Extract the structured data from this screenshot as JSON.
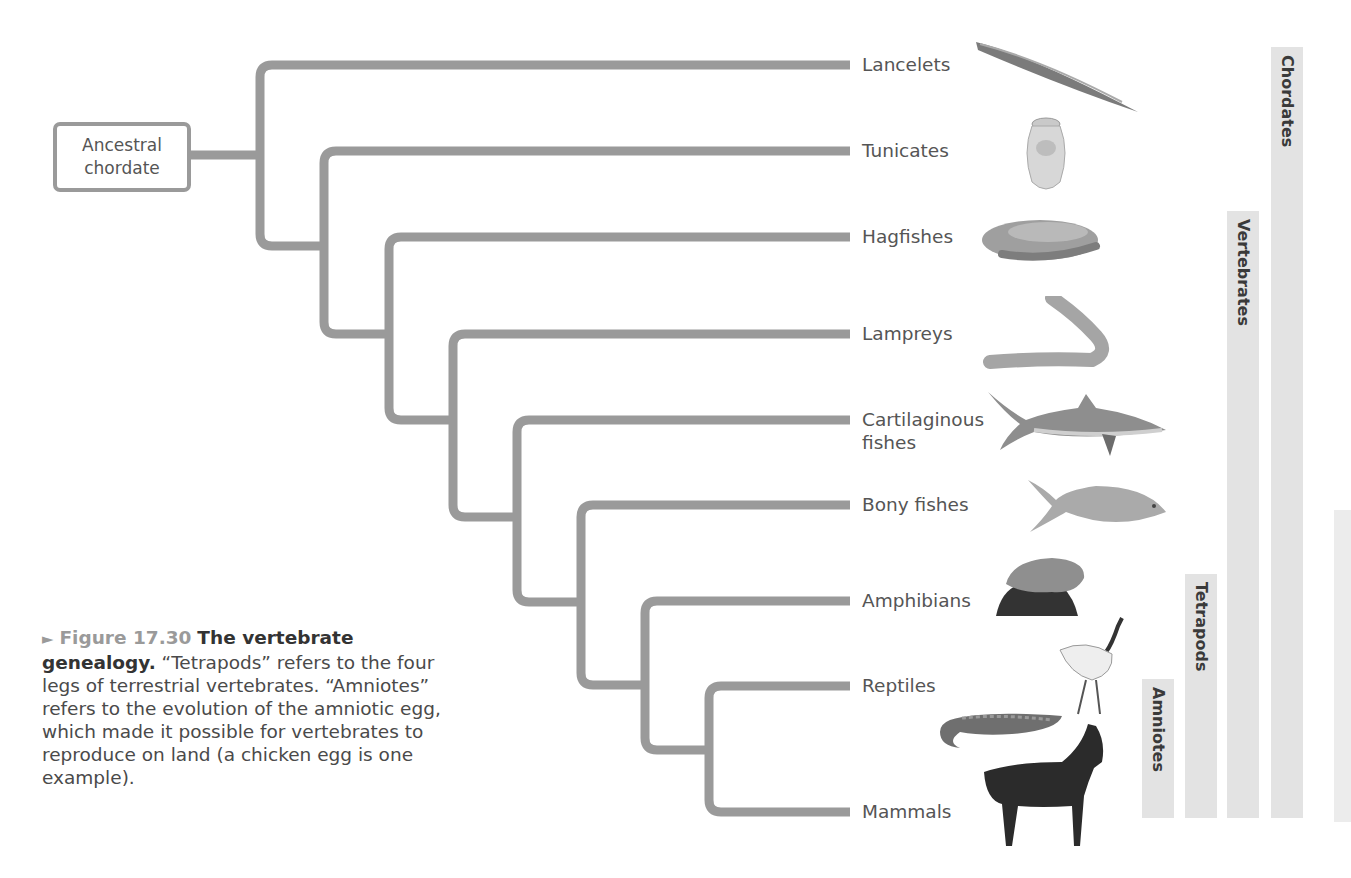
{
  "root": {
    "label_line1": "Ancestral",
    "label_line2": "chordate"
  },
  "taxa": [
    {
      "label": "Lancelets",
      "illustration": "lancelet-icon"
    },
    {
      "label": "Tunicates",
      "illustration": "tunicate-icon"
    },
    {
      "label": "Hagfishes",
      "illustration": "hagfish-icon"
    },
    {
      "label": "Lampreys",
      "illustration": "lamprey-icon"
    },
    {
      "label_line1": "Cartilaginous",
      "label_line2": "fishes",
      "illustration": "shark-icon"
    },
    {
      "label": "Bony fishes",
      "illustration": "bony-fish-icon"
    },
    {
      "label": "Amphibians",
      "illustration": "frog-icon"
    },
    {
      "label": "Reptiles",
      "illustration": "crane-and-lizard-icon"
    },
    {
      "label": "Mammals",
      "illustration": "horse-icon"
    }
  ],
  "clades": [
    {
      "label": "Amniotes",
      "spans": [
        "Reptiles",
        "Mammals"
      ]
    },
    {
      "label": "Tetrapods",
      "spans": [
        "Amphibians",
        "Reptiles",
        "Mammals"
      ]
    },
    {
      "label": "Vertebrates",
      "spans": [
        "Hagfishes",
        "Lampreys",
        "Cartilaginous fishes",
        "Bony fishes",
        "Amphibians",
        "Reptiles",
        "Mammals"
      ]
    },
    {
      "label": "Chordates",
      "spans": [
        "Lancelets",
        "Tunicates",
        "Hagfishes",
        "Lampreys",
        "Cartilaginous fishes",
        "Bony fishes",
        "Amphibians",
        "Reptiles",
        "Mammals"
      ]
    }
  ],
  "caption": {
    "arrow": "►",
    "figure_number": "Figure 17.30",
    "title": "The vertebrate genealogy.",
    "body": " “Tetrapods” refers to the four legs of terrestrial vertebrates. “Amniotes” refers to the evolution of the amniotic egg, which made it possible for vertebrates to reproduce on land (a chicken egg is one example)."
  },
  "colors": {
    "branch": "#9a9a9a",
    "clade_bar": "#e3e3e3",
    "text": "#555555"
  }
}
